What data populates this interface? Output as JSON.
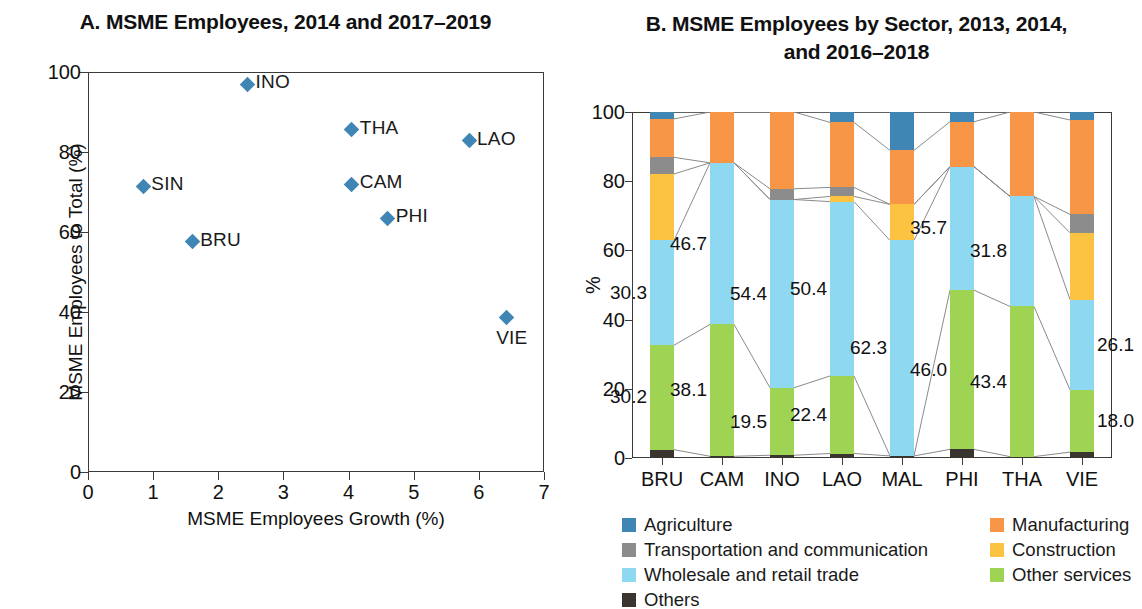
{
  "panelA": {
    "title": "A. MSME Employees, 2014 and 2017–2019",
    "ylabel": "MSME Employees to Total (%)",
    "xlabel": "MSME Employees Growth (%)"
  },
  "panelB": {
    "title_line1": "B. MSME Employees by Sector, 2013, 2014,",
    "title_line2": "and 2016–2018",
    "ylabel": "%"
  },
  "legend": {
    "left": [
      {
        "label": "Agriculture",
        "color": "#3f86b5",
        "icon": "legend-swatch-agriculture"
      },
      {
        "label": "Transportation and communication",
        "color": "#8c8c8c",
        "icon": "legend-swatch-transportation"
      },
      {
        "label": "Wholesale and retail trade",
        "color": "#8ed8f2",
        "icon": "legend-swatch-wholesale"
      },
      {
        "label": "Others",
        "color": "#3b3530",
        "icon": "legend-swatch-others"
      }
    ],
    "right": [
      {
        "label": "Manufacturing",
        "color": "#f79646",
        "icon": "legend-swatch-manufacturing"
      },
      {
        "label": "Construction",
        "color": "#fcc342",
        "icon": "legend-swatch-construction"
      },
      {
        "label": "Other services",
        "color": "#9ed354",
        "icon": "legend-swatch-other-services"
      }
    ]
  },
  "chart_data": [
    {
      "type": "scatter",
      "title": "A. MSME Employees, 2014 and 2017–2019",
      "xlabel": "MSME Employees Growth (%)",
      "ylabel": "MSME Employees to Total (%)",
      "xlim": [
        0,
        7
      ],
      "ylim": [
        0,
        100
      ],
      "xticks": [
        0,
        1,
        2,
        3,
        4,
        5,
        6,
        7
      ],
      "yticks": [
        0,
        20,
        40,
        60,
        80,
        100
      ],
      "grid": false,
      "legend": "none",
      "marker": "diamond",
      "marker_color": "#3f86b5",
      "points": [
        {
          "label": "SIN",
          "x": 0.85,
          "y": 71.4,
          "label_pos": "right"
        },
        {
          "label": "BRU",
          "x": 1.6,
          "y": 57.6,
          "label_pos": "right"
        },
        {
          "label": "INO",
          "x": 2.45,
          "y": 97.0,
          "label_pos": "right"
        },
        {
          "label": "THA",
          "x": 4.05,
          "y": 85.6,
          "label_pos": "right"
        },
        {
          "label": "CAM",
          "x": 4.05,
          "y": 72.0,
          "label_pos": "right"
        },
        {
          "label": "PHI",
          "x": 4.6,
          "y": 63.4,
          "label_pos": "right"
        },
        {
          "label": "LAO",
          "x": 5.85,
          "y": 82.8,
          "label_pos": "right"
        },
        {
          "label": "VIE",
          "x": 6.42,
          "y": 38.7,
          "label_pos": "below"
        }
      ]
    },
    {
      "type": "bar",
      "subtype": "stacked-100",
      "title": "B. MSME Employees by Sector, 2013, 2014, and 2016–2018",
      "xlabel": "",
      "ylabel": "%",
      "ylim": [
        0,
        100
      ],
      "yticks": [
        0,
        20,
        40,
        60,
        80,
        100
      ],
      "grid": false,
      "legend": "bottom",
      "categories": [
        "BRU",
        "CAM",
        "INO",
        "LAO",
        "MAL",
        "PHI",
        "THA",
        "VIE"
      ],
      "series": [
        {
          "name": "Others",
          "color": "#3b3530",
          "values": [
            2.4,
            0.5,
            0.8,
            1.3,
            0.6,
            2.5,
            0.4,
            1.7
          ]
        },
        {
          "name": "Other services",
          "color": "#9ed354",
          "values": [
            30.2,
            38.1,
            19.5,
            22.4,
            0.0,
            46.0,
            43.4,
            18.0
          ]
        },
        {
          "name": "Wholesale and retail trade",
          "color": "#8ed8f2",
          "values": [
            30.3,
            46.7,
            54.4,
            50.4,
            62.3,
            35.7,
            31.8,
            26.1
          ]
        },
        {
          "name": "Construction",
          "color": "#fcc342",
          "values": [
            19.2,
            0.0,
            0.0,
            1.5,
            10.4,
            0.0,
            0.0,
            19.3
          ]
        },
        {
          "name": "Transportation and communication",
          "color": "#8c8c8c",
          "values": [
            4.8,
            0.0,
            3.1,
            2.6,
            0.0,
            0.0,
            0.0,
            5.3
          ]
        },
        {
          "name": "Manufacturing",
          "color": "#f79646",
          "values": [
            11.1,
            14.7,
            22.2,
            18.8,
            15.6,
            13.0,
            24.4,
            27.3
          ]
        },
        {
          "name": "Agriculture",
          "color": "#3f86b5",
          "values": [
            2.0,
            0.0,
            0.0,
            3.0,
            11.1,
            2.8,
            0.0,
            2.3
          ]
        }
      ],
      "data_labels": [
        {
          "category": "BRU",
          "series": "Other services",
          "value": "30.2"
        },
        {
          "category": "BRU",
          "series": "Wholesale and retail trade",
          "value": "30.3"
        },
        {
          "category": "CAM",
          "series": "Other services",
          "value": "38.1"
        },
        {
          "category": "CAM",
          "series": "Wholesale and retail trade",
          "value": "46.7"
        },
        {
          "category": "INO",
          "series": "Other services",
          "value": "19.5"
        },
        {
          "category": "INO",
          "series": "Wholesale and retail trade",
          "value": "54.4"
        },
        {
          "category": "LAO",
          "series": "Other services",
          "value": "22.4"
        },
        {
          "category": "LAO",
          "series": "Wholesale and retail trade",
          "value": "50.4"
        },
        {
          "category": "MAL",
          "series": "Wholesale and retail trade",
          "value": "62.3"
        },
        {
          "category": "PHI",
          "series": "Other services",
          "value": "46.0"
        },
        {
          "category": "PHI",
          "series": "Wholesale and retail trade",
          "value": "35.7"
        },
        {
          "category": "THA",
          "series": "Other services",
          "value": "43.4"
        },
        {
          "category": "THA",
          "series": "Wholesale and retail trade",
          "value": "31.8"
        },
        {
          "category": "VIE",
          "series": "Other services",
          "value": "18.0"
        },
        {
          "category": "VIE",
          "series": "Wholesale and retail trade",
          "value": "26.1"
        }
      ]
    }
  ]
}
